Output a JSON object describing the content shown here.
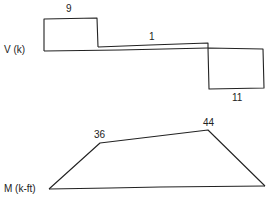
{
  "shear_diagram": {
    "axis_label": "V (k)",
    "values": [
      {
        "label": "9",
        "value": 9
      },
      {
        "label": "1",
        "value": 1
      },
      {
        "label": "11",
        "value": -11
      }
    ]
  },
  "moment_diagram": {
    "axis_label": "M (k-ft)",
    "values": [
      {
        "label": "36",
        "value": 36
      },
      {
        "label": "44",
        "value": 44
      }
    ]
  },
  "colors": {
    "line": "#222222",
    "background": "#ffffff"
  }
}
